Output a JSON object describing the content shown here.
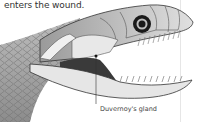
{
  "caption": "enters the wound.",
  "labels": [
    {
      "text": "Duvernoy's gland",
      "target": "gland"
    }
  ],
  "colors": {
    "ink": "#333333",
    "shade_dark": "#444444",
    "shade_mid": "#8a8a8a",
    "shade_light": "#d2d2d2",
    "background": "#ffffff"
  }
}
